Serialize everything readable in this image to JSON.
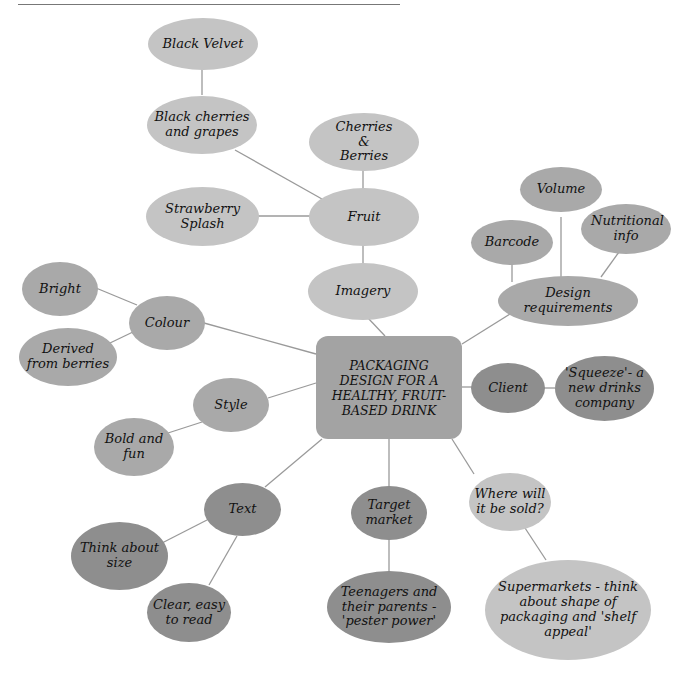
{
  "header": {
    "title_fragment": "...y packaging"
  },
  "center": {
    "label": "PACKAGING DESIGN FOR A HEALTHY, FRUIT-BASED DRINK"
  },
  "nodes": {
    "black_velvet": "Black Velvet",
    "black_cherries": "Black cherries and grapes",
    "cherries_berries": "Cherries & Berries",
    "strawberry": "Strawberry Splash",
    "fruit": "Fruit",
    "imagery": "Imagery",
    "volume": "Volume",
    "barcode": "Barcode",
    "nutritional": "Nutritional info",
    "design_req": "Design requirements",
    "bright": "Bright",
    "colour": "Colour",
    "derived": "Derived from berries",
    "style": "Style",
    "bold": "Bold and fun",
    "client": "Client",
    "squeeze": "'Squeeze'- a new drinks company",
    "text": "Text",
    "think_size": "Think about size",
    "clear": "Clear, easy to read",
    "target": "Target market",
    "teenagers": "Teenagers and their parents - 'pester power'",
    "where": "Where will it be sold?",
    "supermarkets": "Supermarkets - think about shape of packaging and 'shelf appeal'"
  },
  "colors": {
    "light": "#c4c4c4",
    "medium": "#a9a9a9",
    "dark": "#8e8e8e",
    "center": "#a3a3a3",
    "line": "#999999"
  }
}
